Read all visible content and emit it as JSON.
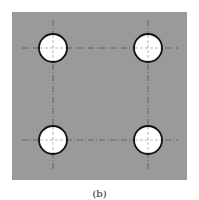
{
  "figure": {
    "caption": "(b)",
    "plate": {
      "x": 12,
      "y": 12,
      "width": 175,
      "height": 168,
      "fill": "#9a9a9a"
    },
    "holes": [
      {
        "cx": 53,
        "cy": 48,
        "r": 14
      },
      {
        "cx": 148,
        "cy": 48,
        "r": 14
      },
      {
        "cx": 53,
        "cy": 140,
        "r": 14
      },
      {
        "cx": 148,
        "cy": 140,
        "r": 14
      }
    ],
    "centerlines": {
      "horizontal_y": [
        48,
        140
      ],
      "vertical_x": [
        53,
        148
      ],
      "h_extent": [
        22,
        178
      ],
      "v_extent": [
        20,
        170
      ]
    },
    "colors": {
      "plate": "#9a9a9a",
      "hole_fill": "#ffffff",
      "hole_stroke": "#111111",
      "centerline": "#555555"
    }
  }
}
